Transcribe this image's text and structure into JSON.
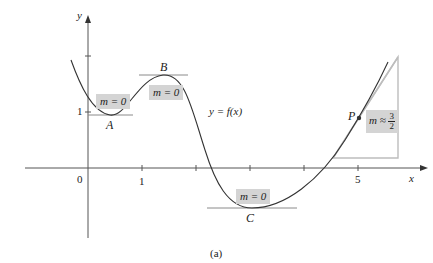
{
  "figure": {
    "caption": "(a)",
    "function_label": "y = f(x)",
    "axes": {
      "x_label": "x",
      "y_label": "y",
      "origin_label": "0",
      "x_ticks": [
        {
          "value": 1,
          "label": "1"
        },
        {
          "value": 2,
          "label": ""
        },
        {
          "value": 3,
          "label": ""
        },
        {
          "value": 4,
          "label": ""
        },
        {
          "value": 5,
          "label": "5"
        }
      ],
      "y_ticks": [
        {
          "value": 1,
          "label": "1"
        },
        {
          "value": 2,
          "label": ""
        }
      ]
    },
    "points": {
      "A": {
        "label": "A",
        "slope_text": "m = 0"
      },
      "B": {
        "label": "B",
        "slope_text": "m = 0"
      },
      "C": {
        "label": "C",
        "slope_text": "m = 0"
      },
      "P": {
        "label": "P",
        "slope_prefix": "m ≈",
        "slope_num": "3",
        "slope_den": "2"
      }
    },
    "colors": {
      "curve": "#333333",
      "axes": "#555555",
      "tangent": "#8a8a8a",
      "label_box": "#d4d4d4",
      "triangle": "#bdbdbd"
    }
  }
}
